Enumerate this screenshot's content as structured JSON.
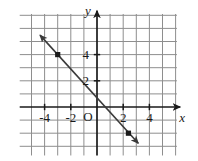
{
  "figure": {
    "title": "",
    "background_color": "#ffffff"
  },
  "chart_data": {
    "type": "line",
    "title": "",
    "xlabel": "x",
    "ylabel": "y",
    "origin_label": "O",
    "xlim": [
      -5.9,
      6.1
    ],
    "ylim": [
      -3.7,
      7.1
    ],
    "x_tick_labels": [
      "-4",
      "-2",
      "2",
      "4"
    ],
    "x_tick_values": [
      -4,
      -2,
      2,
      4
    ],
    "y_tick_labels": [
      "2",
      "4"
    ],
    "y_tick_values": [
      2,
      4
    ],
    "grid": true,
    "grid_spacing": 1,
    "grid_color": "#8e8e8e",
    "axis_color": "#1a1a1a",
    "legend": "none",
    "series": [
      {
        "name": "line",
        "kind": "line",
        "color": "#3a3a3a",
        "slope": -1.1,
        "intercept": 0.7,
        "x_start": -4.35,
        "x_end": 3.15,
        "arrow_start": true,
        "arrow_end": true,
        "points": [
          {
            "x": -3,
            "y": 4
          },
          {
            "x": 2.4,
            "y": -2
          }
        ]
      }
    ]
  }
}
